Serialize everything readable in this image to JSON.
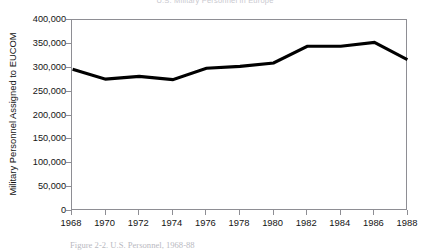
{
  "figure": {
    "title": "U.S. Military Personnel in Europe",
    "caption": "Figure 2-2. U.S. Personnel, 1968-88",
    "line_color": "#000000",
    "axis_color": "#8e8e94",
    "background_color": "#ffffff"
  },
  "chart_data": {
    "type": "line",
    "title": "U.S. Military Personnel in Europe",
    "xlabel": "",
    "ylabel": "Military Personnel Assigned to EUCOM",
    "x": [
      1968,
      1970,
      1972,
      1974,
      1976,
      1978,
      1980,
      1982,
      1984,
      1986,
      1988
    ],
    "categories": [
      "1968",
      "1970",
      "1972",
      "1974",
      "1976",
      "1978",
      "1980",
      "1982",
      "1984",
      "1986",
      "1988"
    ],
    "values": [
      297000,
      276000,
      282000,
      275000,
      299000,
      303000,
      310000,
      345000,
      345000,
      353000,
      317000
    ],
    "series": [
      {
        "name": "Military Personnel Assigned to EUCOM",
        "values": [
          297000,
          276000,
          282000,
          275000,
          299000,
          303000,
          310000,
          345000,
          345000,
          353000,
          317000
        ]
      }
    ],
    "xlim": [
      1968,
      1988
    ],
    "ylim": [
      0,
      400000
    ],
    "ytick_values": [
      0,
      50000,
      100000,
      150000,
      200000,
      250000,
      300000,
      350000,
      400000
    ],
    "ytick_labels": [
      "0",
      "50,000",
      "100,000",
      "150,000",
      "200,000",
      "250,000",
      "300,000",
      "350,000",
      "400,000"
    ],
    "xtick_labels": [
      "1968",
      "1970",
      "1972",
      "1974",
      "1976",
      "1978",
      "1980",
      "1982",
      "1984",
      "1986",
      "1988"
    ],
    "grid": false,
    "legend": false,
    "legend_position": "none",
    "markers": false,
    "line_width": 3
  }
}
